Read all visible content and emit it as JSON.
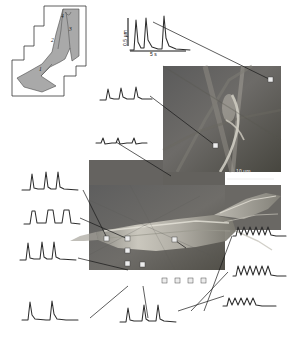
{
  "figure": {
    "background_color": "#ffffff",
    "trace_color": "#2e2e2e",
    "leader_color": "#171717",
    "marker_fill": "#ededed",
    "panel_gray_mid": "#6b6b6b",
    "panel_gray_dark": "#4c4c4c"
  },
  "schematic": {
    "name": "cell-outline-schematic",
    "fill_color": "#a9a9a9",
    "region_labels": [
      {
        "id": "1",
        "text": "1",
        "x": 40,
        "y": 69
      },
      {
        "id": "2",
        "text": "2",
        "x": 52,
        "y": 40
      },
      {
        "id": "3",
        "text": "3",
        "x": 70,
        "y": 29
      },
      {
        "id": "4",
        "text": "4",
        "x": 62,
        "y": 16
      }
    ]
  },
  "scale_bars": {
    "amplitude": {
      "label": "0.5 µm",
      "orientation": "vertical"
    },
    "time": {
      "label": "5 s",
      "orientation": "horizontal"
    },
    "length": {
      "label": "10 µm",
      "orientation": "horizontal"
    }
  },
  "calibration_trace": {
    "name": "calibration-trace",
    "peak_count": 3,
    "description": "Three sharp Ca2+ spikes with decay tails used for amplitude/time calibration"
  },
  "traces": [
    {
      "id": "t-cal",
      "name": "trace-calibration",
      "kind": "spikes",
      "peaks": 3,
      "amplitude": "large",
      "note": "calibration panel top"
    },
    {
      "id": "t-01",
      "name": "trace-upper-left-small",
      "kind": "spikes",
      "peaks": 3,
      "amplitude": "small"
    },
    {
      "id": "t-02",
      "name": "trace-upper-left-flat",
      "kind": "flat-ripples",
      "peaks": 3,
      "amplitude": "tiny"
    },
    {
      "id": "t-03",
      "name": "trace-left-upper-pair",
      "kind": "spikes",
      "peaks": 3,
      "amplitude": "medium"
    },
    {
      "id": "t-04",
      "name": "trace-left-mid-plateau",
      "kind": "plateaus",
      "peaks": 3,
      "amplitude": "medium"
    },
    {
      "id": "t-05",
      "name": "trace-left-lower-triple",
      "kind": "spikes",
      "peaks": 3,
      "amplitude": "medium"
    },
    {
      "id": "t-06",
      "name": "trace-bottom-left-pair",
      "kind": "spikes",
      "peaks": 2,
      "amplitude": "large"
    },
    {
      "id": "t-07",
      "name": "trace-bottom-mid-triple",
      "kind": "spikes",
      "peaks": 3,
      "amplitude": "medium"
    },
    {
      "id": "t-08",
      "name": "trace-right-upper-oscillation",
      "kind": "oscillation",
      "peaks": 6,
      "amplitude": "small"
    },
    {
      "id": "t-09",
      "name": "trace-right-mid-oscillation",
      "kind": "oscillation",
      "peaks": 6,
      "amplitude": "small"
    },
    {
      "id": "t-10",
      "name": "trace-right-lower-oscillation",
      "kind": "oscillation",
      "peaks": 5,
      "amplitude": "small"
    }
  ],
  "measurement_points": [
    {
      "id": "p1",
      "name": "measurement-point-1",
      "x": 271,
      "y": 81
    },
    {
      "id": "p2",
      "name": "measurement-point-2",
      "x": 216,
      "y": 146
    },
    {
      "id": "p3",
      "name": "measurement-point-3",
      "x": 107,
      "y": 239
    },
    {
      "id": "p4",
      "name": "measurement-point-4",
      "x": 128,
      "y": 239
    },
    {
      "id": "p5",
      "name": "measurement-point-5",
      "x": 128,
      "y": 270
    },
    {
      "id": "p6",
      "name": "measurement-point-6",
      "x": 128,
      "y": 285
    },
    {
      "id": "p7",
      "name": "measurement-point-7",
      "x": 143,
      "y": 285
    },
    {
      "id": "p8",
      "name": "measurement-point-8",
      "x": 176,
      "y": 241
    },
    {
      "id": "p9",
      "name": "measurement-point-9",
      "x": 165,
      "y": 311
    },
    {
      "id": "p10",
      "name": "measurement-point-10",
      "x": 178,
      "y": 311
    },
    {
      "id": "p11",
      "name": "measurement-point-11",
      "x": 191,
      "y": 311
    },
    {
      "id": "p12",
      "name": "measurement-point-12",
      "x": 204,
      "y": 311
    }
  ]
}
